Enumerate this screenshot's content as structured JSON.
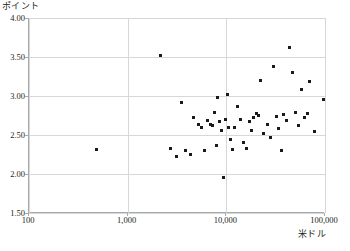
{
  "chart_data": {
    "type": "scatter",
    "title": "",
    "ylabel": "ポイント",
    "xlabel": "米ドル",
    "xscale": "log",
    "yscale": "linear",
    "xlim": [
      100,
      100000
    ],
    "ylim": [
      1.5,
      4.0
    ],
    "grid": true,
    "legend": "none",
    "xticks": [
      "100",
      "1,000",
      "10,000",
      "100,000"
    ],
    "xtick_values": [
      100,
      1000,
      10000,
      100000
    ],
    "yticks": [
      "4.00",
      "3.50",
      "3.00",
      "2.50",
      "2.00",
      "1.50"
    ],
    "ytick_values": [
      4.0,
      3.5,
      3.0,
      2.5,
      2.0,
      1.5
    ],
    "series": [
      {
        "name": "observations",
        "marker": "square",
        "color": "#1a1a1a",
        "points": [
          {
            "x": 480,
            "y": 2.31
          },
          {
            "x": 2150,
            "y": 3.52
          },
          {
            "x": 2700,
            "y": 2.33
          },
          {
            "x": 3100,
            "y": 2.22
          },
          {
            "x": 3500,
            "y": 2.92
          },
          {
            "x": 3900,
            "y": 2.3
          },
          {
            "x": 4300,
            "y": 2.25
          },
          {
            "x": 4700,
            "y": 2.73
          },
          {
            "x": 5200,
            "y": 2.63
          },
          {
            "x": 5600,
            "y": 2.6
          },
          {
            "x": 6000,
            "y": 2.3
          },
          {
            "x": 6400,
            "y": 2.68
          },
          {
            "x": 6900,
            "y": 2.64
          },
          {
            "x": 7200,
            "y": 2.62
          },
          {
            "x": 7600,
            "y": 2.79
          },
          {
            "x": 7900,
            "y": 2.36
          },
          {
            "x": 8200,
            "y": 2.98
          },
          {
            "x": 8600,
            "y": 2.67
          },
          {
            "x": 9000,
            "y": 2.56
          },
          {
            "x": 9300,
            "y": 1.95
          },
          {
            "x": 9700,
            "y": 2.7
          },
          {
            "x": 10200,
            "y": 3.02
          },
          {
            "x": 10600,
            "y": 2.6
          },
          {
            "x": 11000,
            "y": 2.44
          },
          {
            "x": 11500,
            "y": 2.31
          },
          {
            "x": 12000,
            "y": 2.59
          },
          {
            "x": 13000,
            "y": 2.86
          },
          {
            "x": 14000,
            "y": 2.7
          },
          {
            "x": 15000,
            "y": 2.4
          },
          {
            "x": 16000,
            "y": 2.33
          },
          {
            "x": 17000,
            "y": 2.67
          },
          {
            "x": 18000,
            "y": 2.56
          },
          {
            "x": 19000,
            "y": 2.72
          },
          {
            "x": 20000,
            "y": 2.78
          },
          {
            "x": 21000,
            "y": 2.75
          },
          {
            "x": 22000,
            "y": 3.2
          },
          {
            "x": 24000,
            "y": 2.52
          },
          {
            "x": 26000,
            "y": 2.63
          },
          {
            "x": 28000,
            "y": 2.47
          },
          {
            "x": 30000,
            "y": 3.38
          },
          {
            "x": 32000,
            "y": 2.74
          },
          {
            "x": 34000,
            "y": 2.58
          },
          {
            "x": 36000,
            "y": 2.3
          },
          {
            "x": 38000,
            "y": 2.76
          },
          {
            "x": 41000,
            "y": 2.69
          },
          {
            "x": 44000,
            "y": 3.62
          },
          {
            "x": 47000,
            "y": 3.3
          },
          {
            "x": 50000,
            "y": 2.79
          },
          {
            "x": 54000,
            "y": 2.62
          },
          {
            "x": 58000,
            "y": 3.08
          },
          {
            "x": 62000,
            "y": 2.72
          },
          {
            "x": 66000,
            "y": 2.77
          },
          {
            "x": 70000,
            "y": 3.18
          },
          {
            "x": 78000,
            "y": 2.55
          },
          {
            "x": 96000,
            "y": 2.96
          }
        ]
      }
    ]
  },
  "footnote": ""
}
